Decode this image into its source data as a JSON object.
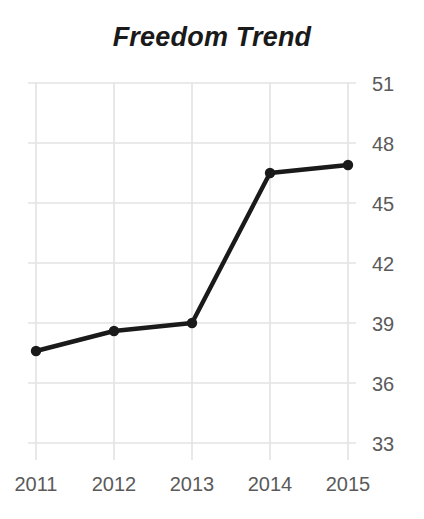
{
  "chart_data": {
    "type": "line",
    "title": "Freedom Trend",
    "xlabel": "",
    "ylabel": "",
    "categories": [
      "2011",
      "2012",
      "2013",
      "2014",
      "2015"
    ],
    "x": [
      2011,
      2012,
      2013,
      2014,
      2015
    ],
    "values": [
      37.6,
      38.6,
      39.0,
      46.5,
      46.9
    ],
    "series": [
      {
        "name": "Freedom Trend",
        "values": [
          37.6,
          38.6,
          39.0,
          46.5,
          46.9
        ]
      }
    ],
    "ylim": [
      33,
      51
    ],
    "xlim": [
      2011,
      2015
    ],
    "yticks": [
      51,
      48,
      45,
      42,
      39,
      36,
      33
    ],
    "ytick_labels": [
      "51",
      "48",
      "45",
      "42",
      "39",
      "36",
      "33"
    ],
    "xticks": [
      2011,
      2012,
      2013,
      2014,
      2015
    ],
    "xtick_labels": [
      "2011",
      "2012",
      "2013",
      "2014",
      "2015"
    ],
    "grid": true,
    "grid_axis": "both",
    "legend": false,
    "legend_position": "none",
    "y_axis_side": "right",
    "marker": "circle",
    "colors": {
      "line": "#1a1a1a",
      "marker": "#1a1a1a",
      "grid": "#e3e3e3",
      "tick_label": "#5a5a5a",
      "title": "#1a1a1a",
      "background": "#ffffff"
    },
    "annotations": []
  }
}
